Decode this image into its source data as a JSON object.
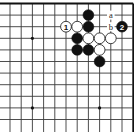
{
  "diagram": {
    "type": "go-board-fragment",
    "corner": "top-right",
    "grid": {
      "columns": 12,
      "rows": 11,
      "col_x0": 10,
      "col_step": 11.2,
      "row_y0": 3.5,
      "row_step": 11.6,
      "edges": {
        "top": true,
        "right": true,
        "left": false,
        "bottom": false
      }
    },
    "star_points": [
      {
        "col": 2,
        "row": 3
      },
      {
        "col": 2,
        "row": 9
      },
      {
        "col": 8,
        "row": 9
      }
    ],
    "stones": [
      {
        "color": "black",
        "col": 7,
        "row": 1,
        "label": ""
      },
      {
        "color": "black",
        "col": 7,
        "row": 2,
        "label": ""
      },
      {
        "color": "white",
        "col": 5,
        "row": 2,
        "label": "1"
      },
      {
        "color": "white",
        "col": 6,
        "row": 2,
        "label": ""
      },
      {
        "color": "black",
        "col": 10,
        "row": 2,
        "label": "2"
      },
      {
        "color": "black",
        "col": 6,
        "row": 3,
        "label": ""
      },
      {
        "color": "white",
        "col": 7,
        "row": 3,
        "label": ""
      },
      {
        "color": "white",
        "col": 8,
        "row": 3,
        "label": ""
      },
      {
        "color": "white",
        "col": 9,
        "row": 3,
        "label": ""
      },
      {
        "color": "black",
        "col": 6,
        "row": 4,
        "label": ""
      },
      {
        "color": "black",
        "col": 7,
        "row": 4,
        "label": ""
      },
      {
        "color": "white",
        "col": 8,
        "row": 4,
        "label": ""
      },
      {
        "color": "black",
        "col": 8,
        "row": 5,
        "label": ""
      }
    ],
    "point_labels": [
      {
        "text": "a",
        "col": 9,
        "row": 1
      },
      {
        "text": "b",
        "col": 9,
        "row": 2
      }
    ],
    "colors": {
      "line": "#3a3a3a",
      "edge": "#111111",
      "black_stone": "#111111",
      "white_stone": "#ffffff",
      "background": "#ffffff"
    }
  }
}
